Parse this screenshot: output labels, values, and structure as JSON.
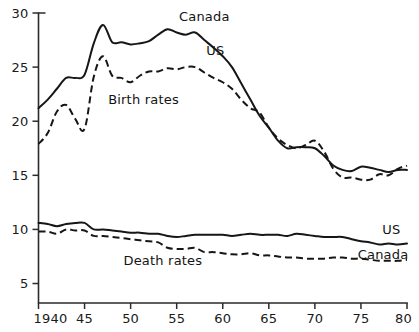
{
  "chart_data": {
    "type": "line",
    "title": "",
    "subtitle": "",
    "xlabel": "",
    "ylabel": "",
    "xlim": [
      1940,
      1980
    ],
    "ylim": [
      3.2,
      30
    ],
    "grid": false,
    "legend_position": "inline-annotations",
    "x_ticks": [
      {
        "value": 1940,
        "label": "1940"
      },
      {
        "value": 1945,
        "label": "45"
      },
      {
        "value": 1950,
        "label": "50"
      },
      {
        "value": 1955,
        "label": "55"
      },
      {
        "value": 1960,
        "label": "60"
      },
      {
        "value": 1965,
        "label": "65"
      },
      {
        "value": 1970,
        "label": "70"
      },
      {
        "value": 1975,
        "label": "75"
      },
      {
        "value": 1980,
        "label": "80"
      }
    ],
    "y_ticks": [
      {
        "value": 5,
        "label": "5"
      },
      {
        "value": 10,
        "label": "10"
      },
      {
        "value": 15,
        "label": "15"
      },
      {
        "value": 20,
        "label": "20"
      },
      {
        "value": 25,
        "label": "25"
      },
      {
        "value": 30,
        "label": "30"
      }
    ],
    "annotations": [
      {
        "text": "Canada",
        "x": 1958.0,
        "y": 29.3,
        "series": "canada-birth-rate"
      },
      {
        "text": "US",
        "x": 1959.2,
        "y": 26.1,
        "series": "us-birth-rate"
      },
      {
        "text": "Birth rates",
        "x": 1951.4,
        "y": 21.6,
        "series": "birth-rates-group"
      },
      {
        "text": "Death rates",
        "x": 1953.5,
        "y": 6.7,
        "series": "death-rates-group"
      },
      {
        "text": "US",
        "x": 1978.3,
        "y": 9.6,
        "series": "us-death-rate"
      },
      {
        "text": "Canada",
        "x": 1977.4,
        "y": 7.3,
        "series": "canada-death-rate"
      }
    ],
    "x": [
      1940,
      1941,
      1942,
      1943,
      1944,
      1945,
      1946,
      1947,
      1948,
      1949,
      1950,
      1951,
      1952,
      1953,
      1954,
      1955,
      1956,
      1957,
      1958,
      1959,
      1960,
      1961,
      1962,
      1963,
      1964,
      1965,
      1966,
      1967,
      1968,
      1969,
      1970,
      1971,
      1972,
      1973,
      1974,
      1975,
      1976,
      1977,
      1978,
      1979,
      1980
    ],
    "series": [
      {
        "name": "Canada",
        "group": "Birth rates",
        "style": "solid",
        "color": "#161616",
        "values": [
          21.2,
          22.0,
          23.0,
          24.0,
          24.0,
          24.3,
          27.2,
          28.9,
          27.3,
          27.3,
          27.1,
          27.2,
          27.4,
          28.0,
          28.5,
          28.2,
          28.0,
          28.2,
          27.5,
          26.8,
          26.0,
          25.0,
          23.5,
          22.0,
          20.5,
          19.4,
          18.2,
          17.5,
          17.6,
          17.6,
          17.5,
          16.8,
          15.9,
          15.5,
          15.4,
          15.8,
          15.7,
          15.5,
          15.3,
          15.5,
          15.5
        ]
      },
      {
        "name": "US",
        "group": "Birth rates",
        "style": "dashed",
        "color": "#161616",
        "values": [
          17.9,
          18.9,
          20.9,
          21.5,
          20.2,
          19.3,
          24.1,
          26.0,
          24.2,
          24.0,
          23.6,
          24.2,
          24.6,
          24.6,
          24.9,
          24.8,
          25.0,
          25.0,
          24.5,
          24.0,
          23.6,
          23.0,
          22.0,
          21.2,
          20.8,
          19.4,
          18.4,
          17.8,
          17.5,
          17.8,
          18.2,
          17.2,
          15.6,
          14.8,
          14.8,
          14.6,
          14.6,
          15.1,
          15.0,
          15.6,
          15.9
        ]
      },
      {
        "name": "US",
        "group": "Death rates",
        "style": "solid",
        "color": "#161616",
        "values": [
          10.6,
          10.5,
          10.3,
          10.5,
          10.6,
          10.6,
          10.0,
          10.0,
          9.9,
          9.8,
          9.7,
          9.7,
          9.6,
          9.6,
          9.4,
          9.3,
          9.4,
          9.5,
          9.5,
          9.5,
          9.5,
          9.4,
          9.5,
          9.6,
          9.5,
          9.5,
          9.5,
          9.4,
          9.6,
          9.5,
          9.4,
          9.3,
          9.3,
          9.3,
          9.1,
          8.9,
          8.8,
          8.6,
          8.7,
          8.6,
          8.7
        ]
      },
      {
        "name": "Canada",
        "group": "Death rates",
        "style": "dashed",
        "color": "#161616",
        "values": [
          9.8,
          9.8,
          9.6,
          10.0,
          9.9,
          9.9,
          9.4,
          9.4,
          9.3,
          9.2,
          9.1,
          9.0,
          8.9,
          8.8,
          8.3,
          8.2,
          8.2,
          8.3,
          7.9,
          7.9,
          7.8,
          7.7,
          7.7,
          7.8,
          7.6,
          7.6,
          7.5,
          7.4,
          7.4,
          7.3,
          7.3,
          7.3,
          7.4,
          7.4,
          7.3,
          7.3,
          7.2,
          7.1,
          7.1,
          7.1,
          7.2
        ]
      }
    ]
  }
}
